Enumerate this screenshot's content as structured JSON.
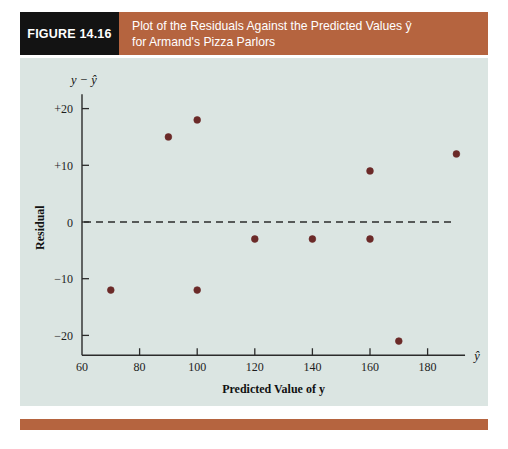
{
  "figure": {
    "number_label": "FIGURE 14.16",
    "caption_line1": "Plot of the Residuals Against the Predicted Values ŷ",
    "caption_line2": "for Armand's Pizza Parlors",
    "header_bg": "#b5643f",
    "number_bg": "#131313",
    "panel_bg": "#dbe5e2",
    "accent_bar_color": "#b5643f"
  },
  "chart_data": {
    "type": "scatter",
    "title": "Plot of the Residuals Against the Predicted Values ŷ for Armand's Pizza Parlors",
    "xlabel": "Predicted Value of y",
    "ylabel": "Residual",
    "x_axis_symbol": "ŷ",
    "y_axis_symbol": "y − ŷ",
    "xlim": [
      60,
      195
    ],
    "ylim": [
      -25,
      22
    ],
    "xticks": [
      60,
      80,
      100,
      120,
      140,
      160,
      180
    ],
    "xtick_labels": [
      "60",
      "80",
      "100",
      "120",
      "140",
      "160",
      "180"
    ],
    "yticks": [
      20,
      10,
      0,
      -10,
      -20
    ],
    "ytick_labels": [
      "+20",
      "+10",
      "0",
      "−10",
      "−20"
    ],
    "grid": false,
    "legend": null,
    "point_color": "#6b2a28",
    "reference_line": {
      "y": 0,
      "style": "dashed",
      "color": "#2b2b2b"
    },
    "points": [
      {
        "x": 70,
        "y": -12
      },
      {
        "x": 90,
        "y": 15
      },
      {
        "x": 100,
        "y": 18
      },
      {
        "x": 100,
        "y": -12
      },
      {
        "x": 120,
        "y": -3
      },
      {
        "x": 140,
        "y": -3
      },
      {
        "x": 160,
        "y": 9
      },
      {
        "x": 160,
        "y": -3
      },
      {
        "x": 170,
        "y": -21
      },
      {
        "x": 190,
        "y": 12
      }
    ]
  }
}
